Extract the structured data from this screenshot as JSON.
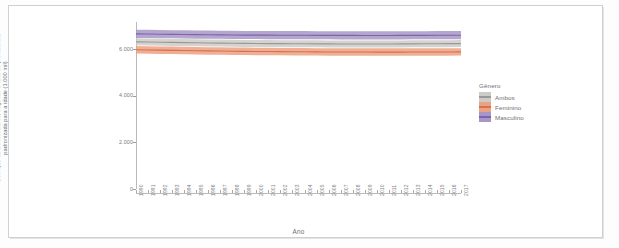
{
  "chart_data": {
    "type": "line",
    "title": "",
    "xlabel": "Ano",
    "ylabel": "Doenças cardiovasculares, segundo a taxa de prevalência padronizada para a idade (1.000 mil)",
    "legend_title": "Gênero",
    "legend_position": "right",
    "grid": false,
    "xlim": [
      1990,
      2017
    ],
    "ylim": [
      0,
      7000
    ],
    "y_ticks": [
      "0",
      "2.000",
      "4.000",
      "6.000"
    ],
    "y_tick_values": [
      0,
      2000,
      4000,
      6000
    ],
    "x": [
      1990,
      1991,
      1992,
      1993,
      1994,
      1995,
      1996,
      1997,
      1998,
      1999,
      2000,
      2001,
      2002,
      2003,
      2004,
      2005,
      2006,
      2007,
      2008,
      2009,
      2010,
      2011,
      2012,
      2013,
      2014,
      2015,
      2016,
      2017
    ],
    "x_tick_labels": [
      "1990",
      "1991",
      "1992",
      "1993",
      "1994",
      "1995",
      "1996",
      "1997",
      "1998",
      "1999",
      "2000",
      "2001",
      "2002",
      "2003",
      "2004",
      "2005",
      "2006",
      "2007",
      "2008",
      "2009",
      "2010",
      "2011",
      "2012",
      "2013",
      "2014",
      "2015",
      "2016",
      "2017"
    ],
    "series": [
      {
        "name": "Masculino",
        "color": "#7b64a8",
        "band_color": "#a796c7",
        "values": [
          6640,
          6635,
          6628,
          6622,
          6615,
          6608,
          6602,
          6598,
          6594,
          6590,
          6588,
          6586,
          6584,
          6582,
          6580,
          6578,
          6577,
          6576,
          6576,
          6575,
          6575,
          6575,
          6576,
          6577,
          6578,
          6580,
          6582,
          6585
        ],
        "lower": [
          6470,
          6465,
          6458,
          6452,
          6445,
          6438,
          6432,
          6428,
          6424,
          6420,
          6418,
          6416,
          6414,
          6412,
          6410,
          6408,
          6407,
          6406,
          6406,
          6405,
          6405,
          6405,
          6406,
          6407,
          6408,
          6410,
          6412,
          6415
        ],
        "upper": [
          6820,
          6815,
          6808,
          6802,
          6795,
          6788,
          6782,
          6778,
          6774,
          6770,
          6768,
          6766,
          6764,
          6762,
          6760,
          6758,
          6757,
          6756,
          6756,
          6755,
          6755,
          6755,
          6756,
          6757,
          6758,
          6760,
          6762,
          6765
        ]
      },
      {
        "name": "Ambos",
        "color": "#9a9896",
        "band_color": "#cdcbc8",
        "values": [
          6300,
          6292,
          6284,
          6276,
          6268,
          6260,
          6252,
          6246,
          6240,
          6234,
          6230,
          6226,
          6222,
          6219,
          6216,
          6214,
          6212,
          6211,
          6210,
          6210,
          6210,
          6211,
          6212,
          6214,
          6216,
          6219,
          6222,
          6226
        ],
        "lower": [
          6150,
          6142,
          6134,
          6126,
          6118,
          6110,
          6102,
          6096,
          6090,
          6084,
          6080,
          6076,
          6072,
          6069,
          6066,
          6064,
          6062,
          6061,
          6060,
          6060,
          6060,
          6061,
          6062,
          6064,
          6066,
          6069,
          6072,
          6076
        ],
        "upper": [
          6450,
          6442,
          6434,
          6426,
          6418,
          6410,
          6402,
          6396,
          6390,
          6384,
          6380,
          6376,
          6372,
          6369,
          6366,
          6364,
          6362,
          6361,
          6360,
          6360,
          6360,
          6361,
          6362,
          6364,
          6366,
          6369,
          6372,
          6376
        ]
      },
      {
        "name": "Feminino",
        "color": "#d4714e",
        "band_color": "#eda183",
        "values": [
          5960,
          5952,
          5944,
          5936,
          5928,
          5920,
          5912,
          5906,
          5900,
          5894,
          5890,
          5886,
          5882,
          5878,
          5874,
          5871,
          5868,
          5866,
          5864,
          5863,
          5862,
          5862,
          5862,
          5863,
          5864,
          5866,
          5868,
          5871
        ],
        "lower": [
          5800,
          5792,
          5784,
          5776,
          5768,
          5760,
          5752,
          5746,
          5740,
          5734,
          5730,
          5726,
          5722,
          5718,
          5714,
          5711,
          5708,
          5706,
          5704,
          5703,
          5702,
          5702,
          5702,
          5703,
          5704,
          5706,
          5708,
          5711
        ],
        "upper": [
          6120,
          6112,
          6104,
          6096,
          6088,
          6080,
          6072,
          6066,
          6060,
          6054,
          6050,
          6046,
          6042,
          6038,
          6034,
          6031,
          6028,
          6026,
          6024,
          6023,
          6022,
          6022,
          6022,
          6023,
          6024,
          6026,
          6028,
          6031
        ]
      }
    ]
  },
  "legend": {
    "title": "Gênero",
    "items": [
      {
        "label": "Ambos",
        "color": "#9a9896",
        "band_color": "#cdcbc8"
      },
      {
        "label": "Feminino",
        "color": "#d4714e",
        "band_color": "#eda183"
      },
      {
        "label": "Masculino",
        "color": "#7b64a8",
        "band_color": "#a796c7"
      }
    ]
  },
  "axes": {
    "y_title": "Doenças cardiovasculares, segundo a taxa de prevalência padronizada para a idade (1.000 mil)",
    "x_title": "Ano"
  }
}
